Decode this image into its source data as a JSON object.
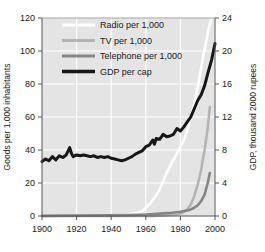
{
  "chart_data": {
    "type": "line",
    "title": "",
    "subtitle": "",
    "xlabel": "",
    "ylabel": "Goods per 1,000 inhabitants",
    "y2label": "GDP, thousand 2000 rupees",
    "xlim": [
      1900,
      2000
    ],
    "ylim": [
      0,
      120
    ],
    "y2lim": [
      0,
      24
    ],
    "xticks": [
      1900,
      1920,
      1940,
      1960,
      1980,
      2000
    ],
    "xtick_labels": [
      "1900",
      "1920",
      "1940",
      "1960",
      "1980",
      "2000"
    ],
    "yticks": [
      0,
      20,
      40,
      60,
      80,
      100,
      120
    ],
    "ytick_labels": [
      "0",
      "20",
      "40",
      "60",
      "80",
      "100",
      "120"
    ],
    "y2ticks": [
      0,
      4,
      8,
      12,
      16,
      20,
      24
    ],
    "y2tick_labels": [
      "0",
      "4",
      "8",
      "12",
      "16",
      "20",
      "24"
    ],
    "grid": true,
    "grid_color": "#ffffff",
    "plot_background": "#e4e4e4",
    "legend_position": "top-center",
    "series": [
      {
        "name": "Radio per 1,000",
        "color": "#ffffff",
        "axis": "left",
        "width": 2.6,
        "x": [
          1900,
          1910,
          1920,
          1930,
          1940,
          1945,
          1950,
          1955,
          1958,
          1960,
          1962,
          1965,
          1968,
          1970,
          1972,
          1975,
          1978,
          1980,
          1982,
          1984,
          1986,
          1988,
          1990,
          1992,
          1994,
          1996,
          1998,
          1999
        ],
        "values": [
          0,
          0,
          0,
          0,
          0.3,
          0.6,
          1.0,
          2.0,
          3.0,
          5.0,
          7.0,
          11.0,
          16.0,
          21.0,
          26.0,
          32.0,
          38.0,
          42.0,
          46.0,
          52.0,
          60.0,
          68.0,
          78.0,
          90.0,
          101.0,
          112.0,
          120.0,
          123.0
        ]
      },
      {
        "name": "TV per 1,000",
        "color": "#b4b4b4",
        "axis": "left",
        "width": 2.6,
        "x": [
          1900,
          1930,
          1950,
          1960,
          1965,
          1970,
          1975,
          1978,
          1980,
          1982,
          1984,
          1986,
          1988,
          1990,
          1992,
          1994,
          1996,
          1997
        ],
        "values": [
          0,
          0,
          0,
          0,
          0.1,
          0.3,
          0.6,
          1.0,
          1.5,
          2.5,
          4.0,
          7.0,
          12.0,
          19.0,
          28.0,
          40.0,
          55.0,
          66.0
        ]
      },
      {
        "name": "Telephone per 1,000",
        "color": "#858585",
        "axis": "left",
        "width": 2.6,
        "x": [
          1900,
          1920,
          1940,
          1950,
          1960,
          1965,
          1970,
          1975,
          1980,
          1984,
          1986,
          1988,
          1990,
          1992,
          1994,
          1996,
          1997
        ],
        "values": [
          0.1,
          0.2,
          0.4,
          0.6,
          0.9,
          1.2,
          1.6,
          2.0,
          2.6,
          3.3,
          4.0,
          5.0,
          6.5,
          9.0,
          13.0,
          21.0,
          26.0
        ]
      },
      {
        "name": "GDP per cap",
        "color": "#171717",
        "axis": "right",
        "width": 3.0,
        "x": [
          1900,
          1902,
          1904,
          1906,
          1908,
          1910,
          1912,
          1914,
          1916,
          1917,
          1918,
          1920,
          1922,
          1924,
          1926,
          1928,
          1930,
          1932,
          1934,
          1936,
          1938,
          1940,
          1942,
          1944,
          1946,
          1948,
          1950,
          1952,
          1954,
          1956,
          1958,
          1960,
          1962,
          1964,
          1965,
          1966,
          1968,
          1970,
          1972,
          1974,
          1976,
          1978,
          1980,
          1982,
          1984,
          1986,
          1988,
          1990,
          1992,
          1994,
          1996,
          1998,
          2000
        ],
        "values": [
          6.6,
          6.9,
          6.7,
          7.2,
          6.8,
          7.3,
          7.1,
          7.4,
          8.3,
          7.6,
          7.2,
          7.4,
          7.3,
          7.4,
          7.3,
          7.2,
          7.3,
          7.1,
          7.2,
          7.1,
          7.2,
          7.0,
          6.9,
          6.8,
          6.7,
          6.8,
          7.0,
          7.2,
          7.5,
          7.7,
          7.9,
          8.4,
          8.6,
          9.2,
          8.7,
          9.4,
          9.3,
          9.9,
          9.6,
          9.7,
          9.9,
          10.6,
          10.3,
          10.8,
          11.4,
          12.0,
          13.0,
          14.0,
          14.7,
          15.8,
          17.4,
          18.9,
          20.9
        ]
      }
    ]
  },
  "legend": {
    "items": [
      {
        "label": "Radio per 1,000"
      },
      {
        "label": "TV per 1,000"
      },
      {
        "label": "Telephone per 1,000"
      },
      {
        "label": "GDP per cap"
      }
    ]
  }
}
